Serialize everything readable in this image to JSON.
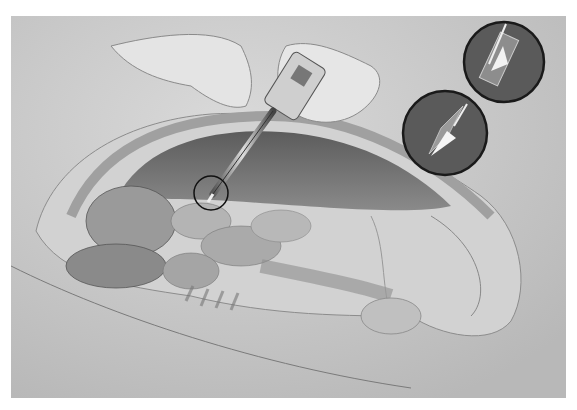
{
  "illustration": {
    "subject": "laparoscopic trocar insertion into the abdomen",
    "style": "grayscale medical drawing",
    "callouts": [
      {
        "name": "trocar-tip-detail-top",
        "depicts": "trocar sheath tip close-up"
      },
      {
        "name": "trocar-tip-detail-bottom",
        "depicts": "sharp trocar blade close-up"
      }
    ],
    "highlight": "circle marking trocar entry point",
    "colors": {
      "background": "#ffffff",
      "paper": "#c9c9c9",
      "cavity": "#6e6e6e",
      "callout_fill": "#5a5a5a",
      "outline": "#1a1a1a"
    }
  }
}
